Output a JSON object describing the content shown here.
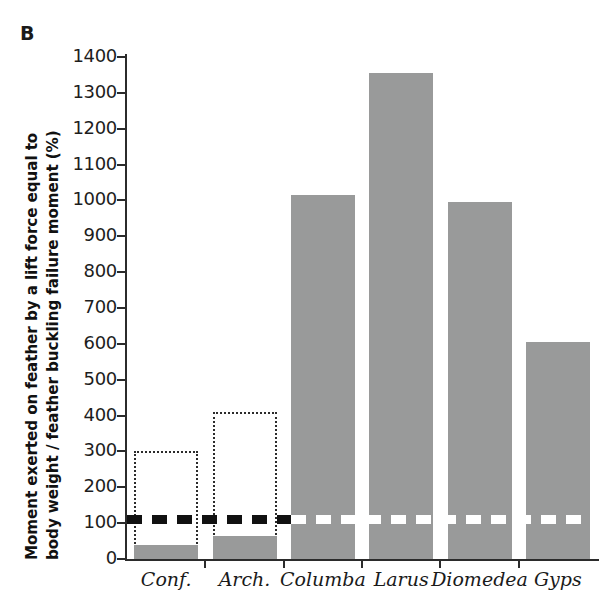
{
  "panel": {
    "letter": "B"
  },
  "chart_data": {
    "type": "bar",
    "title": "",
    "subtitle": "",
    "xlabel": "",
    "ylabel_line_1": "Moment exerted on feather by a lift force equal to",
    "ylabel_line_2": "body weight / feather buckling failure moment (%)",
    "ylabel": "Moment exerted on feather by a lift force equal to body weight / feather buckling failure moment (%)",
    "categories": [
      "Conf.",
      "Arch.",
      "Columba",
      "Larus",
      "Diomedea",
      "Gyps"
    ],
    "values": [
      40,
      65,
      1015,
      1355,
      995,
      605
    ],
    "error_boxes": [
      {
        "category": "Conf.",
        "upper": 300,
        "lower": 0
      },
      {
        "category": "Arch.",
        "upper": 410,
        "lower": 0
      }
    ],
    "threshold": {
      "value": 110,
      "label": "",
      "style": "dashed"
    },
    "ylim": [
      0,
      1400
    ],
    "ytick_values": [
      0,
      100,
      200,
      300,
      400,
      500,
      600,
      700,
      800,
      900,
      1000,
      1100,
      1200,
      1300,
      1400
    ],
    "ytick_labels": [
      "0",
      "100",
      "200",
      "300",
      "400",
      "500",
      "600",
      "700",
      "800",
      "900",
      "1000",
      "1100",
      "1200",
      "1300",
      "1400"
    ],
    "grid": false,
    "legend": "none",
    "bar_color": "#999a9a",
    "axis_color": "#2b2b2b",
    "threshold_color_dark": "#111111",
    "threshold_color_light": "#ffffff",
    "errorbox_color": "#2b2b2b",
    "background_color": "#ffffff"
  }
}
